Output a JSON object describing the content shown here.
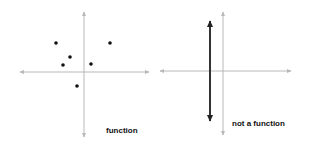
{
  "colors": {
    "axis": "#b8b8b8",
    "point": "#111111",
    "vertical_line": "#333333",
    "background": "#ffffff"
  },
  "panels": [
    {
      "id": "left",
      "label": "function",
      "axes": {
        "x_start": 20,
        "x_end": 149,
        "y_axis_x": 84,
        "y_start": 12,
        "y_end": 137,
        "x_axis_y": 72
      },
      "points": [
        {
          "x": 56,
          "y": 43
        },
        {
          "x": 110,
          "y": 43
        },
        {
          "x": 70,
          "y": 57
        },
        {
          "x": 63,
          "y": 65
        },
        {
          "x": 91,
          "y": 64
        },
        {
          "x": 77,
          "y": 86
        }
      ]
    },
    {
      "id": "right",
      "label": "not a function",
      "axes": {
        "x_start": 160,
        "x_end": 291,
        "y_axis_x": 223,
        "y_start": 12,
        "y_end": 135,
        "x_axis_y": 71
      },
      "vertical_line": {
        "x": 210,
        "y_start": 21,
        "y_end": 121
      }
    }
  ]
}
